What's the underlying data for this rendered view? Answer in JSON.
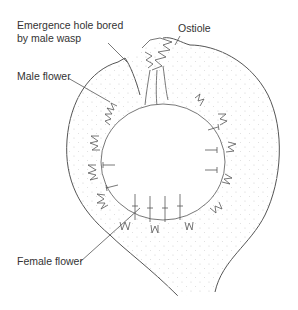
{
  "diagram": {
    "labels": {
      "emergence_hole_line1": "Emergence hole bored",
      "emergence_hole_line2": "by male wasp",
      "ostiole": "Ostiole",
      "male_flower": "Male flower",
      "female_flower": "Female flower"
    },
    "colors": {
      "line": "#555555",
      "text": "#333333",
      "stipple": "#cccccc",
      "background": "#ffffff"
    }
  }
}
